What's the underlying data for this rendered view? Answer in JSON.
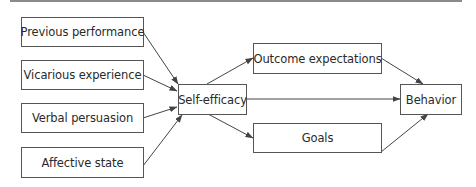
{
  "diagram": {
    "title": "",
    "colors": {
      "box_border": "#555555",
      "text": "#2a2a2a",
      "arrow": "#444444",
      "top_rule": "#8a8a8a"
    },
    "nodes": {
      "previous_performance": {
        "label": "Previous performance"
      },
      "vicarious_experience": {
        "label": "Vicarious experience"
      },
      "verbal_persuasion": {
        "label": "Verbal persuasion"
      },
      "affective_state": {
        "label": "Affective state"
      },
      "self_efficacy": {
        "label": "Self-efficacy"
      },
      "outcome_expectations": {
        "label": "Outcome expectations"
      },
      "goals": {
        "label": "Goals"
      },
      "behavior": {
        "label": "Behavior"
      }
    },
    "edges": [
      {
        "from": "Previous performance",
        "to": "Self-efficacy"
      },
      {
        "from": "Vicarious experience",
        "to": "Self-efficacy"
      },
      {
        "from": "Verbal persuasion",
        "to": "Self-efficacy"
      },
      {
        "from": "Affective state",
        "to": "Self-efficacy"
      },
      {
        "from": "Self-efficacy",
        "to": "Outcome expectations"
      },
      {
        "from": "Self-efficacy",
        "to": "Behavior"
      },
      {
        "from": "Self-efficacy",
        "to": "Goals"
      },
      {
        "from": "Outcome expectations",
        "to": "Behavior"
      },
      {
        "from": "Goals",
        "to": "Behavior"
      }
    ]
  }
}
